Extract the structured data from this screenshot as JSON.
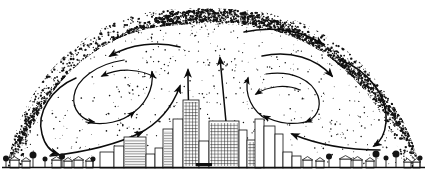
{
  "figure": {
    "type": "schematic-diagram",
    "background_color": "#ffffff",
    "ink_color": "#0d0d0d",
    "width_px": 427,
    "height_px": 173
  },
  "dome": {
    "name": "dust-dome",
    "description": "Stippled particulate dome arching over the city",
    "apex_x": 205,
    "apex_y": 9,
    "left_base_x": 8,
    "right_base_x": 420,
    "base_y": 166,
    "stipple_band_thickness": 26,
    "stipple_density_edge": "dense",
    "stipple_density_interior": "sparse",
    "dot_color": "#111111"
  },
  "ground": {
    "name": "ground-line",
    "y": 167,
    "x_start": 2,
    "x_end": 425,
    "color": "#0d0d0d"
  },
  "circulation": {
    "label": "air-circulation-cells",
    "cells": [
      {
        "name": "left-vortex",
        "rotation": "counterclockwise",
        "center_x": 105,
        "center_y": 100
      },
      {
        "name": "right-vortex",
        "rotation": "clockwise",
        "center_x": 305,
        "center_y": 98
      },
      {
        "name": "central-updraft",
        "rotation": "rising",
        "center_x": 205,
        "center_y": 90
      }
    ],
    "arrow_count": 16,
    "arrow_color": "#0b0b0b"
  },
  "skyline": {
    "name": "city-center-skyline",
    "x_start": 100,
    "x_end": 300,
    "tallest_building_height_px": 72,
    "buildings": [
      {
        "x": 100,
        "y": 152,
        "w": 14,
        "h": 16,
        "hatch": "none"
      },
      {
        "x": 114,
        "y": 146,
        "w": 10,
        "h": 22,
        "hatch": "none"
      },
      {
        "x": 124,
        "y": 137,
        "w": 22,
        "h": 31,
        "hatch": "horizontal"
      },
      {
        "x": 146,
        "y": 154,
        "w": 9,
        "h": 14,
        "hatch": "none"
      },
      {
        "x": 155,
        "y": 148,
        "w": 8,
        "h": 20,
        "hatch": "none"
      },
      {
        "x": 163,
        "y": 129,
        "w": 10,
        "h": 39,
        "hatch": "horizontal"
      },
      {
        "x": 173,
        "y": 119,
        "w": 10,
        "h": 49,
        "hatch": "none"
      },
      {
        "x": 183,
        "y": 100,
        "w": 16,
        "h": 68,
        "hatch": "grid"
      },
      {
        "x": 199,
        "y": 141,
        "w": 10,
        "h": 27,
        "hatch": "none"
      },
      {
        "x": 209,
        "y": 121,
        "w": 30,
        "h": 47,
        "hatch": "grid"
      },
      {
        "x": 239,
        "y": 130,
        "w": 8,
        "h": 38,
        "hatch": "none"
      },
      {
        "x": 247,
        "y": 140,
        "w": 14,
        "h": 28,
        "hatch": "grid"
      },
      {
        "x": 255,
        "y": 119,
        "w": 9,
        "h": 49,
        "hatch": "none"
      },
      {
        "x": 264,
        "y": 126,
        "w": 11,
        "h": 42,
        "hatch": "none"
      },
      {
        "x": 275,
        "y": 134,
        "w": 8,
        "h": 34,
        "hatch": "none"
      },
      {
        "x": 283,
        "y": 152,
        "w": 9,
        "h": 16,
        "hatch": "none"
      },
      {
        "x": 292,
        "y": 156,
        "w": 9,
        "h": 12,
        "hatch": "none"
      }
    ]
  },
  "suburbs": {
    "name": "suburban-fringe",
    "left": {
      "x_start": 6,
      "x_end": 98,
      "houses": [
        {
          "x": 10,
          "y": 160,
          "w": 9,
          "h": 8
        },
        {
          "x": 22,
          "y": 161,
          "w": 8,
          "h": 7
        },
        {
          "x": 52,
          "y": 160,
          "w": 9,
          "h": 8
        },
        {
          "x": 64,
          "y": 161,
          "w": 8,
          "h": 7
        },
        {
          "x": 74,
          "y": 160,
          "w": 9,
          "h": 8
        },
        {
          "x": 86,
          "y": 161,
          "w": 7,
          "h": 7
        }
      ],
      "trees": [
        {
          "x": 6,
          "y": 162,
          "r": 3
        },
        {
          "x": 33,
          "y": 159,
          "r": 3.5
        },
        {
          "x": 45,
          "y": 162,
          "r": 2.5
        },
        {
          "x": 62,
          "y": 160,
          "r": 3
        },
        {
          "x": 93,
          "y": 162,
          "r": 2.5
        }
      ]
    },
    "right": {
      "x_start": 300,
      "x_end": 424,
      "houses": [
        {
          "x": 303,
          "y": 160,
          "w": 9,
          "h": 8
        },
        {
          "x": 316,
          "y": 161,
          "w": 8,
          "h": 7
        },
        {
          "x": 340,
          "y": 159,
          "w": 11,
          "h": 9
        },
        {
          "x": 353,
          "y": 160,
          "w": 9,
          "h": 8
        },
        {
          "x": 366,
          "y": 161,
          "w": 8,
          "h": 7
        },
        {
          "x": 404,
          "y": 162,
          "w": 7,
          "h": 6
        },
        {
          "x": 413,
          "y": 162,
          "w": 7,
          "h": 6
        }
      ],
      "trees": [
        {
          "x": 329,
          "y": 160,
          "r": 3
        },
        {
          "x": 376,
          "y": 158,
          "r": 3.5
        },
        {
          "x": 386,
          "y": 161,
          "r": 2.5
        },
        {
          "x": 396,
          "y": 158,
          "r": 3.5
        },
        {
          "x": 420,
          "y": 161,
          "r": 2.5
        }
      ]
    }
  }
}
